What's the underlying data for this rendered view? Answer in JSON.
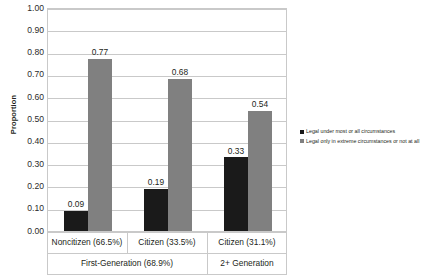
{
  "chart_data": {
    "type": "bar",
    "title": "",
    "xlabel": "",
    "ylabel": "Proportion",
    "ylim": [
      0.0,
      1.0
    ],
    "ytick_step": 0.1,
    "grid": true,
    "legend_position": "right",
    "categories": [
      "Noncitizen (66.5%)",
      "Citizen (33.5%)",
      "Citizen (31.1%)"
    ],
    "group_labels": [
      "First-Generation (68.9%)",
      "2+ Generation"
    ],
    "series": [
      {
        "name": "Legal under most or all circumstances",
        "color": "#1a1a1a",
        "values": [
          0.09,
          0.19,
          0.33
        ],
        "labels": [
          "0.09",
          "0.19",
          "0.33"
        ]
      },
      {
        "name": "Legal only in extreme circumstances or not at all",
        "color": "#808080",
        "values": [
          0.77,
          0.68,
          0.54
        ],
        "labels": [
          "0.77",
          "0.68",
          "0.54"
        ]
      }
    ],
    "ytick_labels": [
      "1.00",
      "0.90",
      "0.80",
      "0.70",
      "0.60",
      "0.50",
      "0.40",
      "0.30",
      "0.20",
      "0.10",
      "0.00"
    ]
  },
  "axis": {
    "y_title": "Proportion"
  },
  "legend": {
    "entries": [
      {
        "label": "Legal under most or all circumstances",
        "color": "#1a1a1a"
      },
      {
        "label": "Legal only in extreme circumstances or not at all",
        "color": "#808080"
      }
    ]
  },
  "colors": {
    "series_dark": "#1a1a1a",
    "series_gray": "#808080",
    "gridline": "#c9c9c9",
    "text": "#231f20",
    "background": "#ffffff"
  }
}
